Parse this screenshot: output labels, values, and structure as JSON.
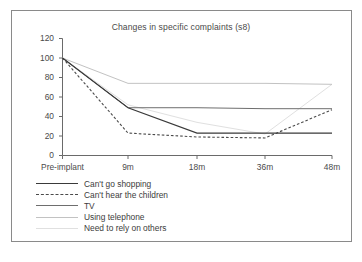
{
  "chart_data": {
    "type": "line",
    "title": "Changes in specific complaints (s8)",
    "xlabel": "",
    "ylabel": "",
    "categories": [
      "Pre-implant",
      "9m",
      "18m",
      "36m",
      "48m"
    ],
    "ylim": [
      0,
      120
    ],
    "yticks": [
      0,
      20,
      40,
      60,
      80,
      100,
      120
    ],
    "grid": false,
    "legend_position": "below-plot",
    "series": [
      {
        "name": "Can't go shopping",
        "values": [
          100,
          49,
          23,
          23,
          23
        ],
        "style": "solid",
        "color": "#3a3a3a",
        "width": 1.1
      },
      {
        "name": "Can't hear the children",
        "values": [
          100,
          23,
          19,
          18,
          47
        ],
        "style": "dashed",
        "color": "#4a4a4a",
        "width": 1.1
      },
      {
        "name": "TV",
        "values": [
          100,
          49,
          49,
          48,
          48
        ],
        "style": "solid",
        "color": "#6e6e6e",
        "width": 1.0
      },
      {
        "name": "Using telephone",
        "values": [
          100,
          74,
          74,
          74,
          73
        ],
        "style": "solid",
        "color": "#c2c2c2",
        "width": 1.0
      },
      {
        "name": "Need to rely on others",
        "values": [
          100,
          52,
          34,
          22,
          73
        ],
        "style": "solid",
        "color": "#e0e0e0",
        "width": 1.0
      }
    ]
  },
  "axis": {
    "y_tick_labels": [
      "120",
      "100",
      "80",
      "60",
      "40",
      "20",
      "0"
    ],
    "x_tick_labels": [
      "Pre-implant",
      "9m",
      "18m",
      "36m",
      "48m"
    ]
  },
  "legend": {
    "items": [
      {
        "label": "Can't go shopping"
      },
      {
        "label": "Can't hear the children"
      },
      {
        "label": "TV"
      },
      {
        "label": "Using telephone"
      },
      {
        "label": "Need to rely on others"
      }
    ]
  }
}
